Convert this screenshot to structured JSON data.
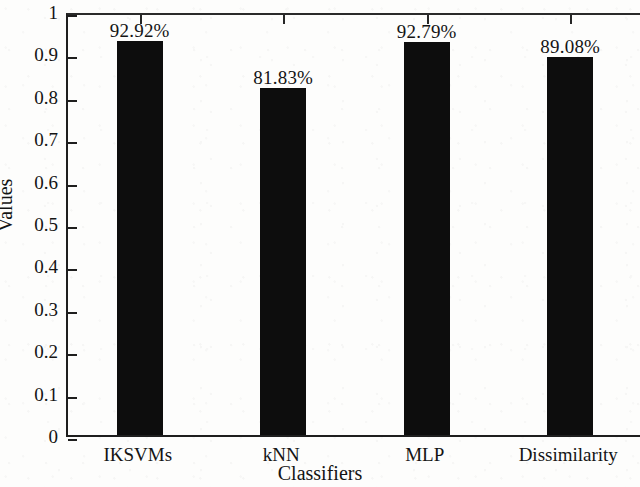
{
  "chart_data": {
    "type": "bar",
    "title": "",
    "subtitle": "",
    "xlabel": "Classifiers",
    "ylabel": "Values",
    "categories": [
      "IKSVMs",
      "kNN",
      "MLP",
      "Dissimilarity"
    ],
    "values": [
      0.9292,
      0.8183,
      0.9279,
      0.8908
    ],
    "data_labels": [
      "92.92%",
      "81.83%",
      "92.79%",
      "89.08%"
    ],
    "ylim": [
      0,
      1
    ],
    "yticks": [
      0,
      0.1,
      0.2,
      0.3,
      0.4,
      0.5,
      0.6,
      0.7,
      0.8,
      0.9,
      1
    ],
    "ytick_labels": [
      "0",
      "0.1",
      "0.2",
      "0.3",
      "0.4",
      "0.5",
      "0.6",
      "0.7",
      "0.8",
      "0.9",
      "1"
    ],
    "grid": false,
    "legend": null,
    "legend_position": "none",
    "bar_color": "#0d0d0d",
    "axis_color": "#1e1e1e",
    "background_color": "#fdfdfc",
    "series": [
      {
        "name": "Values",
        "values": [
          0.9292,
          0.8183,
          0.9279,
          0.8908
        ]
      }
    ]
  }
}
